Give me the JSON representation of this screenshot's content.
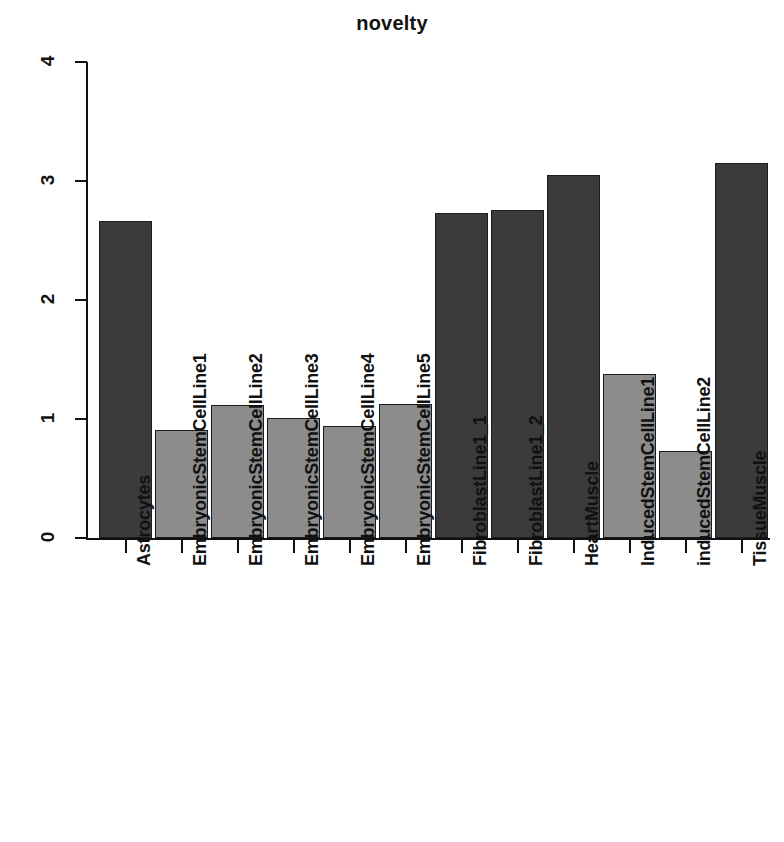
{
  "chart_data": {
    "type": "bar",
    "title": "novelty",
    "xlabel": "",
    "ylabel": "",
    "ylim": [
      0,
      4
    ],
    "yticks": [
      0,
      1,
      2,
      3,
      4
    ],
    "ytick_labels": [
      "0",
      "1",
      "2",
      "3",
      "4"
    ],
    "grid": false,
    "legend": false,
    "categories": [
      "Astrocytes",
      "EmbryonicStemCellLine1",
      "EmbryonicStemCellLine2",
      "EmbryonicStemCellLine3",
      "EmbryonicStemCellLine4",
      "EmbryonicStemCellLine5",
      "FibroblastLine1_1",
      "FibroblastLine1_2",
      "HeartMuscle",
      "InducedStemCellLine1",
      "inducedStemCellLine2",
      "TissueMuscle"
    ],
    "values": [
      2.66,
      0.91,
      1.12,
      1.01,
      0.94,
      1.13,
      2.73,
      2.76,
      3.05,
      1.38,
      0.73,
      3.15
    ],
    "bar_colors": [
      "#3b3b3b",
      "#8c8c8c",
      "#8c8c8c",
      "#8c8c8c",
      "#8c8c8c",
      "#8c8c8c",
      "#3b3b3b",
      "#3b3b3b",
      "#3b3b3b",
      "#8c8c8c",
      "#8c8c8c",
      "#3b3b3b"
    ],
    "colors": {
      "dark_bar": "#3b3b3b",
      "light_bar": "#8c8c8c",
      "axis": "#111111",
      "background": "#ffffff",
      "text": "#111111"
    }
  }
}
